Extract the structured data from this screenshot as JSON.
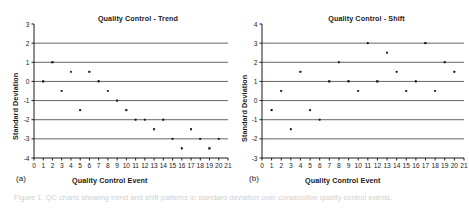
{
  "figure": {
    "caption_partial": "Figure 1.  QC charts showing trend and shift patterns in standard deviation over consecutive quality control events."
  },
  "panels": [
    {
      "key": "a",
      "sublabel": "(a)",
      "title": "Quality Control - Trend",
      "ylabel": "Standard Deviation",
      "xlabel": "Quality Control Event"
    },
    {
      "key": "b",
      "sublabel": "(b)",
      "title": "Quality Control - Shift",
      "ylabel": "Standard Deviation",
      "xlabel": "Quality Control Event"
    }
  ],
  "chart_data": [
    {
      "type": "scatter",
      "panel": "a",
      "title": "Quality Control - Trend",
      "xlabel": "Quality Control Event",
      "ylabel": "Standard Deviation",
      "xlim": [
        0,
        21
      ],
      "ylim": [
        -4,
        3
      ],
      "xticks": [
        0,
        1,
        2,
        3,
        4,
        5,
        6,
        7,
        8,
        9,
        10,
        11,
        12,
        13,
        14,
        15,
        16,
        17,
        18,
        19,
        20,
        21
      ],
      "xticklabels": [
        "0",
        "1",
        "2",
        "3",
        "4",
        "5",
        "6",
        "7",
        "8",
        "9",
        "10",
        "11",
        "12",
        "13",
        "14",
        "15",
        "16",
        "17",
        "18",
        "19",
        "20",
        "21"
      ],
      "yticks": [
        -4,
        -3,
        -2,
        -1,
        0,
        1,
        2,
        3
      ],
      "yticklabels": [
        "-4",
        "-3",
        "-2",
        "-1",
        "0",
        "1",
        "2",
        "3"
      ],
      "gridlines_y": [
        2,
        1,
        0,
        -1,
        -2,
        -3
      ],
      "grid": true,
      "legend": "none",
      "marker": "small-filled-square",
      "x": [
        1,
        2,
        3,
        4,
        5,
        6,
        7,
        8,
        9,
        10,
        11,
        12,
        13,
        14,
        15,
        16,
        17,
        18,
        19,
        20
      ],
      "values": [
        0,
        1,
        -0.5,
        0.5,
        -1.5,
        0.5,
        0,
        -0.5,
        -1,
        -1.5,
        -2,
        -2,
        -2.5,
        -2,
        -3,
        -3.5,
        -2.5,
        -3,
        -3.5,
        -3
      ]
    },
    {
      "type": "scatter",
      "panel": "b",
      "title": "Quality Control - Shift",
      "xlabel": "Quality Control Event",
      "ylabel": "Standard Deviation",
      "xlim": [
        0,
        21
      ],
      "ylim": [
        -3,
        4
      ],
      "xticks": [
        0,
        1,
        2,
        3,
        4,
        5,
        6,
        7,
        8,
        9,
        10,
        11,
        12,
        13,
        14,
        15,
        16,
        17,
        18,
        19,
        20,
        21
      ],
      "xticklabels": [
        "0",
        "1",
        "2",
        "3",
        "4",
        "5",
        "6",
        "7",
        "8",
        "9",
        "10",
        "11",
        "12",
        "13",
        "14",
        "15",
        "16",
        "17",
        "18",
        "19",
        "20",
        "21"
      ],
      "yticks": [
        -3,
        -2,
        -1,
        0,
        1,
        2,
        3,
        4
      ],
      "yticklabels": [
        "-3",
        "-2",
        "-1",
        "0",
        "1",
        "2",
        "3",
        "4"
      ],
      "gridlines_y": [
        3,
        2,
        1,
        0,
        -1,
        -2
      ],
      "grid": true,
      "legend": "none",
      "marker": "small-filled-square",
      "x": [
        1,
        2,
        3,
        4,
        5,
        6,
        7,
        8,
        9,
        10,
        11,
        12,
        13,
        14,
        15,
        16,
        17,
        18,
        19,
        20
      ],
      "values": [
        -0.5,
        0.5,
        -1.5,
        1.5,
        -0.5,
        -1,
        1,
        2,
        1,
        0.5,
        3,
        1,
        2.5,
        1.5,
        0.5,
        1,
        3,
        0.5,
        2,
        1.5
      ]
    }
  ],
  "colors": {
    "axis": "#1a1a1a",
    "grid": "#555555",
    "marker": "#111111",
    "background": "#ffffff",
    "caption": "#cfcfcf"
  }
}
